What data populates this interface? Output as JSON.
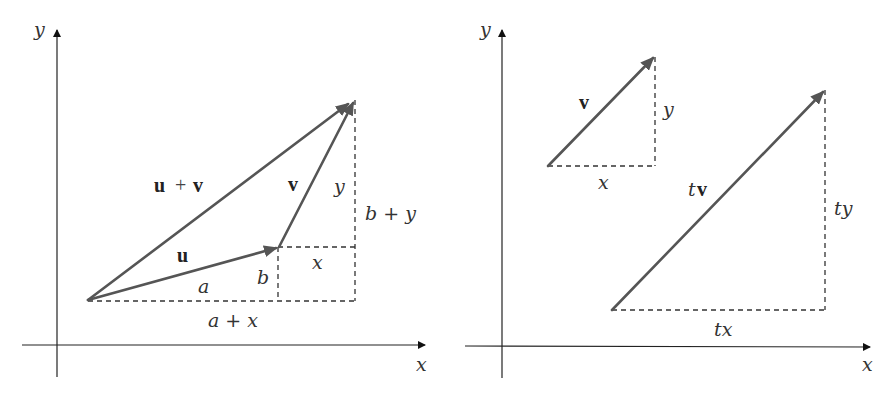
{
  "panels": [
    {
      "id": "vector-addition",
      "axes": {
        "x_label": "x",
        "y_label": "y"
      },
      "vectors": [
        {
          "name": "u",
          "label": "u",
          "from": [
            88,
            300
          ],
          "to": [
            278,
            247
          ]
        },
        {
          "name": "v",
          "label": "v",
          "from": [
            278,
            247
          ],
          "to": [
            353,
            103
          ]
        },
        {
          "name": "u_plus_v",
          "label_parts": [
            "u",
            "+",
            "v"
          ],
          "from": [
            88,
            300
          ],
          "to": [
            349,
            103
          ]
        }
      ],
      "labels": {
        "u_plus_v_u": "u",
        "u_plus_v_plus": "+",
        "u_plus_v_v": "v",
        "u": "u",
        "v": "v",
        "a": "a",
        "b": "b",
        "x": "x",
        "y": "y",
        "a_plus_x": "a + x",
        "b_plus_y": "b + y"
      }
    },
    {
      "id": "scalar-multiplication",
      "axes": {
        "x_label": "x",
        "y_label": "y"
      },
      "vectors": [
        {
          "name": "v",
          "label": "v",
          "from": [
            548,
            166
          ],
          "to": [
            654,
            57
          ]
        },
        {
          "name": "t_v",
          "label": "tv",
          "from": [
            612,
            310
          ],
          "to": [
            824,
            91
          ]
        }
      ],
      "labels": {
        "v": "v",
        "x": "x",
        "y": "y",
        "tv_t": "t",
        "tv_v": "v",
        "tx": "tx",
        "ty": "ty"
      }
    }
  ],
  "colors": {
    "vector": "#555555",
    "axis": "#222222",
    "dashed": "#333333",
    "text": "#333333"
  }
}
